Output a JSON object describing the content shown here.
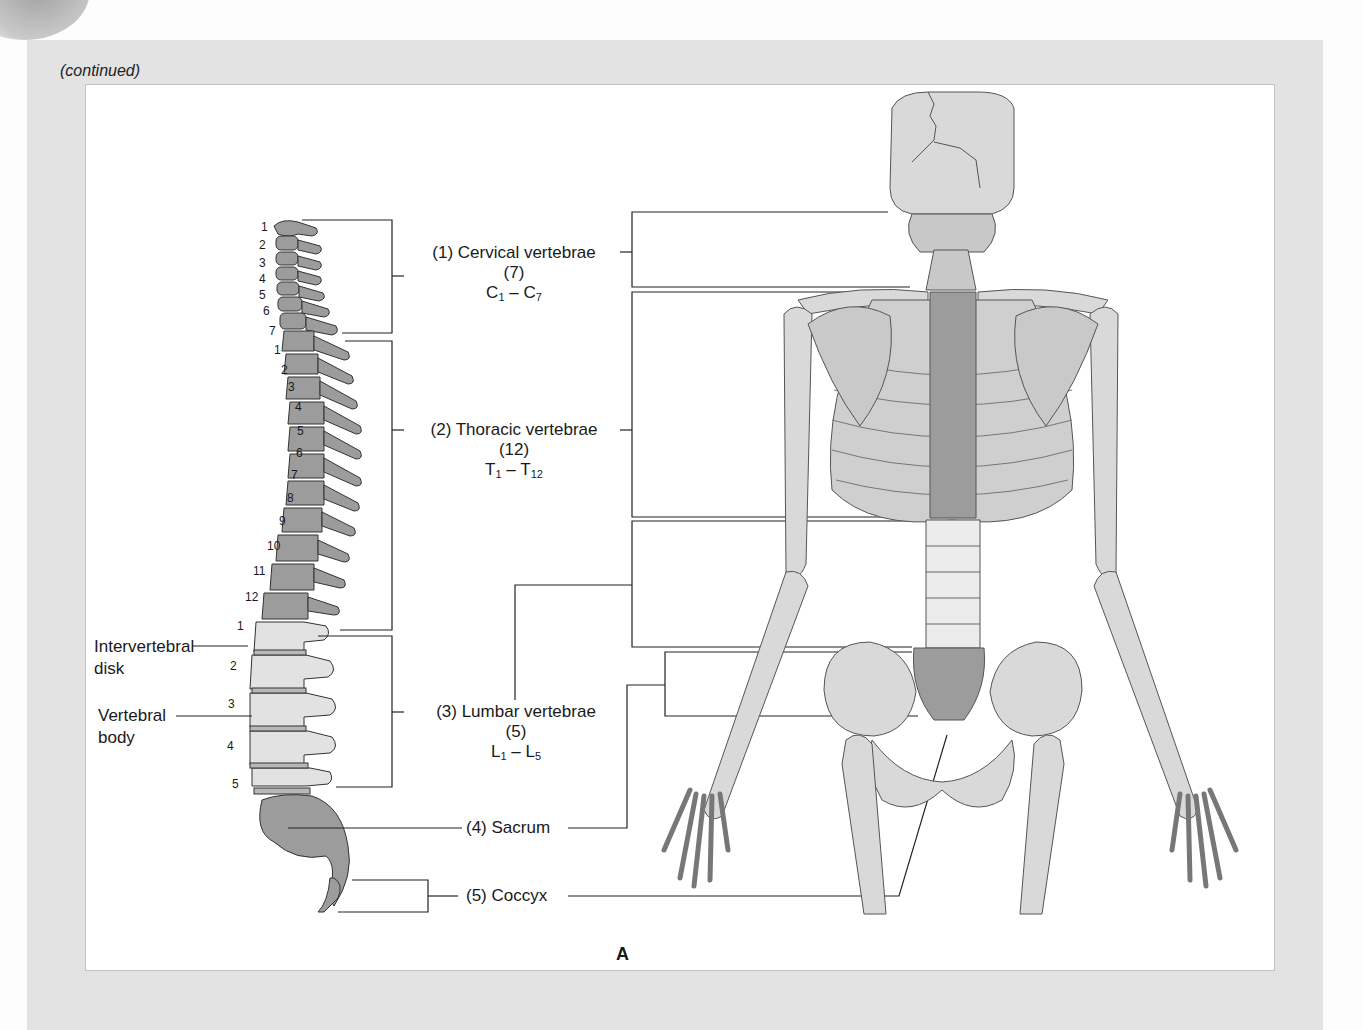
{
  "header": {
    "continued": "(continued)"
  },
  "figure_label": "A",
  "regions": [
    {
      "name": "(1) Cervical vertebrae",
      "count": "(7)",
      "range_prefix": "C",
      "range_start": "1",
      "range_end": "7"
    },
    {
      "name": "(2) Thoracic vertebrae",
      "count": "(12)",
      "range_prefix": "T",
      "range_start": "1",
      "range_end": "12"
    },
    {
      "name": "(3) Lumbar vertebrae",
      "count": "(5)",
      "range_prefix": "L",
      "range_start": "1",
      "range_end": "5"
    },
    {
      "name": "(4) Sacrum"
    },
    {
      "name": "(5) Coccyx"
    }
  ],
  "side_labels": {
    "intervertebral_1": "Intervertebral",
    "intervertebral_2": "disk",
    "vertebral_1": "Vertebral",
    "vertebral_2": "body"
  },
  "dash": "–",
  "cervical_numbers": [
    "1",
    "2",
    "3",
    "4",
    "5",
    "6",
    "7"
  ],
  "thoracic_numbers": [
    "1",
    "2",
    "3",
    "4",
    "5",
    "6",
    "7",
    "8",
    "9",
    "10",
    "11",
    "12"
  ],
  "lumbar_numbers": [
    "1",
    "2",
    "3",
    "4",
    "5"
  ],
  "colors": {
    "panel": "#e3e3e3",
    "bone_dark": "#9a9a9a",
    "bone_light": "#d6d6d6",
    "bone_pale": "#e6e6e6"
  }
}
